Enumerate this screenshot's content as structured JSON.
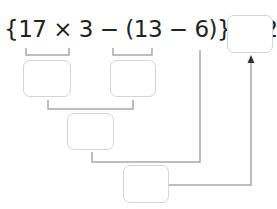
{
  "expression": {
    "text": "{17 × 3 − (13 − 6)} ÷ 2 =",
    "parts": [
      "{17 × 3",
      " − ",
      "(13 − 6)",
      "} ÷ 2 ="
    ]
  },
  "boxes": {
    "answer": "",
    "step1_product": "",
    "step2_difference": "",
    "step3_subtract": "",
    "step4_divide": ""
  },
  "colors": {
    "text": "#222222",
    "box_border": "#d4d4d4",
    "connector": "#a8a8a8",
    "arrow": "#333333"
  }
}
